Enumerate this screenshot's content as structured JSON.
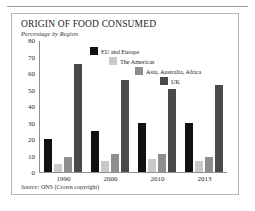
{
  "figure": {
    "title": "ORIGIN OF FOOD CONSUMED",
    "subtitle": "Percentage by Region",
    "source_lead": "Source:",
    "source_text": "ONS (Crown copyright)"
  },
  "colors": {
    "eu": "#111111",
    "americas": "#c9c9c9",
    "asia": "#8e8e8e",
    "uk": "#4a4a4a",
    "axis": "#8d8d8d",
    "border": "#b5b5b5"
  },
  "chart_data": {
    "type": "bar",
    "title": "ORIGIN OF FOOD CONSUMED",
    "subtitle": "Percentage by Region",
    "xlabel": "",
    "ylabel": "",
    "ylim": [
      0,
      80
    ],
    "yticks": [
      0,
      10,
      20,
      30,
      40,
      50,
      60,
      70,
      80
    ],
    "grid": false,
    "legend_position": "upper-center-staggered",
    "categories": [
      "1990",
      "2000",
      "2010",
      "2013"
    ],
    "series": [
      {
        "name": "EU and Europe",
        "color": "#111111",
        "values": [
          20,
          25,
          30,
          30
        ]
      },
      {
        "name": "The Americas",
        "color": "#c9c9c9",
        "values": [
          5,
          7,
          8,
          7
        ]
      },
      {
        "name": "Asia, Australia, Africa",
        "color": "#8e8e8e",
        "values": [
          9,
          11,
          11,
          9
        ]
      },
      {
        "name": "UK",
        "color": "#4a4a4a",
        "values": [
          66,
          56,
          51,
          53
        ]
      }
    ],
    "source": "Source: ONS (Crown copyright)"
  }
}
